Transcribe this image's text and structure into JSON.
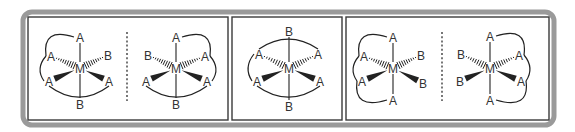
{
  "figure": {
    "outer_frame": {
      "x": 23,
      "y": 12,
      "w": 531,
      "h": 113,
      "rx": 9,
      "stroke": "#9a9a9a",
      "stroke_width": 5
    },
    "panel_stroke": "#3a3a3a",
    "bond_color": "#222222",
    "arc_color": "#222222",
    "label_color": "#333333",
    "divider_color": "#555555"
  },
  "panels": [
    {
      "name": "panel-1",
      "box": {
        "x": 28,
        "y": 17,
        "w": 200,
        "h": 103
      },
      "divider_x": 127,
      "molecules": [
        {
          "name": "molecule-1a",
          "center": {
            "label": "M",
            "x": 80,
            "y": 68
          },
          "ligands": [
            {
              "pos": "top",
              "label": "A",
              "x": 80,
              "y": 37,
              "bond": "line"
            },
            {
              "pos": "upper-left",
              "label": "A",
              "x": 51,
              "y": 56,
              "bond": "hash"
            },
            {
              "pos": "upper-right",
              "label": "B",
              "x": 108,
              "y": 55,
              "bond": "hash"
            },
            {
              "pos": "lower-left",
              "label": "A",
              "x": 49,
              "y": 81,
              "bond": "wedge"
            },
            {
              "pos": "lower-right",
              "label": "A",
              "x": 109,
              "y": 81,
              "bond": "wedge"
            },
            {
              "pos": "bottom",
              "label": "B",
              "x": 80,
              "y": 104,
              "bond": "line"
            }
          ],
          "arcs": [
            [
              "top",
              "upper-left",
              "left"
            ],
            [
              "upper-left",
              "lower-left",
              "left"
            ],
            [
              "lower-left",
              "lower-right",
              "down"
            ]
          ]
        },
        {
          "name": "molecule-1b",
          "center": {
            "label": "M",
            "x": 176,
            "y": 68
          },
          "ligands": [
            {
              "pos": "top",
              "label": "A",
              "x": 176,
              "y": 37,
              "bond": "line"
            },
            {
              "pos": "upper-left",
              "label": "B",
              "x": 148,
              "y": 55,
              "bond": "hash"
            },
            {
              "pos": "upper-right",
              "label": "A",
              "x": 205,
              "y": 56,
              "bond": "hash"
            },
            {
              "pos": "lower-left",
              "label": "A",
              "x": 146,
              "y": 81,
              "bond": "wedge"
            },
            {
              "pos": "lower-right",
              "label": "A",
              "x": 207,
              "y": 81,
              "bond": "wedge"
            },
            {
              "pos": "bottom",
              "label": "B",
              "x": 176,
              "y": 104,
              "bond": "line"
            }
          ],
          "arcs": [
            [
              "top",
              "upper-right",
              "right"
            ],
            [
              "upper-right",
              "lower-right",
              "right"
            ],
            [
              "lower-left",
              "lower-right",
              "down"
            ]
          ]
        }
      ]
    },
    {
      "name": "panel-2",
      "box": {
        "x": 232,
        "y": 17,
        "w": 110,
        "h": 103
      },
      "divider_x": null,
      "molecules": [
        {
          "name": "molecule-2",
          "center": {
            "label": "M",
            "x": 289,
            "y": 68
          },
          "ligands": [
            {
              "pos": "top",
              "label": "B",
              "x": 289,
              "y": 31,
              "bond": "line"
            },
            {
              "pos": "upper-left",
              "label": "A",
              "x": 259,
              "y": 54,
              "bond": "hash"
            },
            {
              "pos": "upper-right",
              "label": "A",
              "x": 318,
              "y": 54,
              "bond": "hash"
            },
            {
              "pos": "lower-left",
              "label": "A",
              "x": 257,
              "y": 81,
              "bond": "wedge"
            },
            {
              "pos": "lower-right",
              "label": "A",
              "x": 320,
              "y": 81,
              "bond": "wedge"
            },
            {
              "pos": "bottom",
              "label": "B",
              "x": 289,
              "y": 106,
              "bond": "line"
            }
          ],
          "arcs": [
            [
              "upper-left",
              "upper-right",
              "up"
            ],
            [
              "upper-left",
              "lower-left",
              "left"
            ],
            [
              "lower-left",
              "lower-right",
              "down"
            ]
          ]
        }
      ]
    },
    {
      "name": "panel-3",
      "box": {
        "x": 346,
        "y": 17,
        "w": 203,
        "h": 103
      },
      "divider_x": 442,
      "molecules": [
        {
          "name": "molecule-3a",
          "center": {
            "label": "M",
            "x": 393,
            "y": 68
          },
          "ligands": [
            {
              "pos": "top",
              "label": "A",
              "x": 393,
              "y": 37,
              "bond": "line"
            },
            {
              "pos": "upper-left",
              "label": "A",
              "x": 364,
              "y": 56,
              "bond": "hash"
            },
            {
              "pos": "upper-right",
              "label": "B",
              "x": 421,
              "y": 55,
              "bond": "hash"
            },
            {
              "pos": "lower-left",
              "label": "A",
              "x": 362,
              "y": 81,
              "bond": "wedge"
            },
            {
              "pos": "lower-right",
              "label": "B",
              "x": 423,
              "y": 83,
              "bond": "wedge"
            },
            {
              "pos": "bottom",
              "label": "A",
              "x": 393,
              "y": 100,
              "bond": "line"
            }
          ],
          "arcs": [
            [
              "top",
              "upper-left",
              "left"
            ],
            [
              "upper-left",
              "lower-left",
              "left"
            ],
            [
              "lower-left",
              "bottom",
              "left"
            ]
          ]
        },
        {
          "name": "molecule-3b",
          "center": {
            "label": "M",
            "x": 490,
            "y": 68
          },
          "ligands": [
            {
              "pos": "top",
              "label": "A",
              "x": 490,
              "y": 36,
              "bond": "line"
            },
            {
              "pos": "upper-left",
              "label": "B",
              "x": 461,
              "y": 54,
              "bond": "hash"
            },
            {
              "pos": "upper-right",
              "label": "A",
              "x": 519,
              "y": 55,
              "bond": "hash"
            },
            {
              "pos": "lower-left",
              "label": "B",
              "x": 460,
              "y": 81,
              "bond": "wedge"
            },
            {
              "pos": "lower-right",
              "label": "A",
              "x": 521,
              "y": 81,
              "bond": "wedge"
            },
            {
              "pos": "bottom",
              "label": "A",
              "x": 490,
              "y": 100,
              "bond": "line"
            }
          ],
          "arcs": [
            [
              "top",
              "upper-right",
              "right"
            ],
            [
              "upper-right",
              "lower-right",
              "right"
            ],
            [
              "lower-right",
              "bottom",
              "right"
            ]
          ]
        }
      ]
    }
  ]
}
